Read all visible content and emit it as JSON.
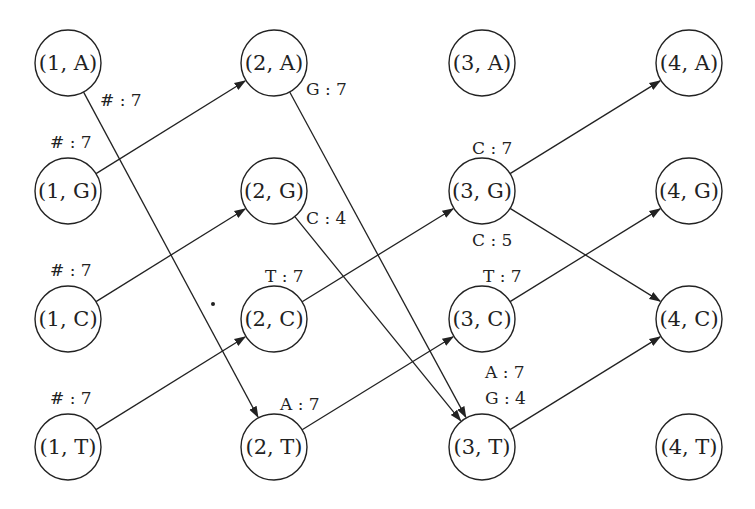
{
  "diagram": {
    "type": "trellis-graph",
    "nodes": [
      {
        "id": "1A",
        "label": "(1, A)",
        "x": 68,
        "y": 63
      },
      {
        "id": "1G",
        "label": "(1, G)",
        "x": 68,
        "y": 191
      },
      {
        "id": "1C",
        "label": "(1, C)",
        "x": 68,
        "y": 319
      },
      {
        "id": "1T",
        "label": "(1, T)",
        "x": 68,
        "y": 447
      },
      {
        "id": "2A",
        "label": "(2, A)",
        "x": 274,
        "y": 63
      },
      {
        "id": "2G",
        "label": "(2, G)",
        "x": 274,
        "y": 191
      },
      {
        "id": "2C",
        "label": "(2, C)",
        "x": 274,
        "y": 319
      },
      {
        "id": "2T",
        "label": "(2, T)",
        "x": 274,
        "y": 447
      },
      {
        "id": "3A",
        "label": "(3, A)",
        "x": 482,
        "y": 63
      },
      {
        "id": "3G",
        "label": "(3, G)",
        "x": 482,
        "y": 191
      },
      {
        "id": "3C",
        "label": "(3, C)",
        "x": 482,
        "y": 319
      },
      {
        "id": "3T",
        "label": "(3, T)",
        "x": 482,
        "y": 447
      },
      {
        "id": "4A",
        "label": "(4, A)",
        "x": 689,
        "y": 63
      },
      {
        "id": "4G",
        "label": "(4, G)",
        "x": 689,
        "y": 191
      },
      {
        "id": "4C",
        "label": "(4, C)",
        "x": 689,
        "y": 319
      },
      {
        "id": "4T",
        "label": "(4, T)",
        "x": 689,
        "y": 447
      }
    ],
    "edges": [
      {
        "from": "1A",
        "to": "2T",
        "label": "# : 7",
        "lx": 100,
        "ly": 106
      },
      {
        "from": "1G",
        "to": "2A",
        "label": "# : 7",
        "lx": 50,
        "ly": 148
      },
      {
        "from": "1C",
        "to": "2G",
        "label": "# : 7",
        "lx": 50,
        "ly": 276
      },
      {
        "from": "1T",
        "to": "2C",
        "label": "# : 7",
        "lx": 50,
        "ly": 404
      },
      {
        "from": "2A",
        "to": "3T",
        "label": "G : 7",
        "lx": 306,
        "ly": 95
      },
      {
        "from": "2G",
        "to": "3T",
        "label": "C : 4",
        "lx": 306,
        "ly": 224
      },
      {
        "from": "2C",
        "to": "3G",
        "label": "T : 7",
        "lx": 265,
        "ly": 282
      },
      {
        "from": "2T",
        "to": "3C",
        "label": "A : 7",
        "lx": 280,
        "ly": 410
      },
      {
        "from": "3G",
        "to": "4A",
        "label": "C : 7",
        "lx": 472,
        "ly": 154
      },
      {
        "from": "3G",
        "to": "4C",
        "label": "C : 5",
        "lx": 472,
        "ly": 246
      },
      {
        "from": "3C",
        "to": "4G",
        "label": "T : 7",
        "lx": 483,
        "ly": 282
      },
      {
        "from": "3T",
        "to": "4C",
        "label": "A : 7",
        "lx": 485,
        "ly": 378
      },
      {
        "from": "3T",
        "to": "4C",
        "label": "G : 4",
        "lx": 485,
        "ly": 404
      }
    ],
    "stray_dot": {
      "x": 213,
      "y": 304
    }
  }
}
